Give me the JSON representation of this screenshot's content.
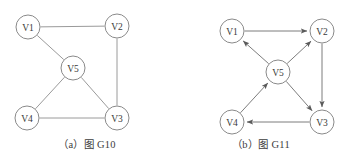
{
  "figure": {
    "panels": [
      {
        "id": "G10",
        "caption": "（a）图 G10",
        "graph_type": "undirected",
        "nodes": [
          {
            "id": "V1",
            "label": "V1",
            "cx": 28,
            "cy": 27,
            "r": 12
          },
          {
            "id": "V2",
            "label": "V2",
            "cx": 117,
            "cy": 26,
            "r": 12
          },
          {
            "id": "V5",
            "label": "V5",
            "cx": 73,
            "cy": 68,
            "r": 12
          },
          {
            "id": "V4",
            "label": "V4",
            "cx": 27,
            "cy": 118,
            "r": 12
          },
          {
            "id": "V3",
            "label": "V3",
            "cx": 117,
            "cy": 118,
            "r": 12
          }
        ],
        "edges": [
          {
            "from": "V1",
            "to": "V2"
          },
          {
            "from": "V1",
            "to": "V5"
          },
          {
            "from": "V2",
            "to": "V3"
          },
          {
            "from": "V5",
            "to": "V4"
          },
          {
            "from": "V5",
            "to": "V3"
          },
          {
            "from": "V4",
            "to": "V3"
          }
        ]
      },
      {
        "id": "G11",
        "caption": "（b）图 G11",
        "graph_type": "directed",
        "nodes": [
          {
            "id": "V1",
            "label": "V1",
            "cx": 58,
            "cy": 31,
            "r": 12
          },
          {
            "id": "V2",
            "label": "V2",
            "cx": 148,
            "cy": 31,
            "r": 12
          },
          {
            "id": "V5",
            "label": "V5",
            "cx": 104,
            "cy": 72,
            "r": 12
          },
          {
            "id": "V4",
            "label": "V4",
            "cx": 58,
            "cy": 122,
            "r": 12
          },
          {
            "id": "V3",
            "label": "V3",
            "cx": 148,
            "cy": 122,
            "r": 12
          }
        ],
        "edges": [
          {
            "from": "V1",
            "to": "V2"
          },
          {
            "from": "V2",
            "to": "V3"
          },
          {
            "from": "V3",
            "to": "V4"
          },
          {
            "from": "V4",
            "to": "V5"
          },
          {
            "from": "V5",
            "to": "V1"
          },
          {
            "from": "V5",
            "to": "V2"
          },
          {
            "from": "V5",
            "to": "V3"
          }
        ]
      }
    ]
  },
  "colors": {
    "background": "#ffffff",
    "node_stroke": "#8a8a8a",
    "node_fill": "#ffffff",
    "edge_stroke": "#9a9a9a",
    "arc_stroke": "#7d7d7d",
    "text": "#3a3a3a"
  }
}
